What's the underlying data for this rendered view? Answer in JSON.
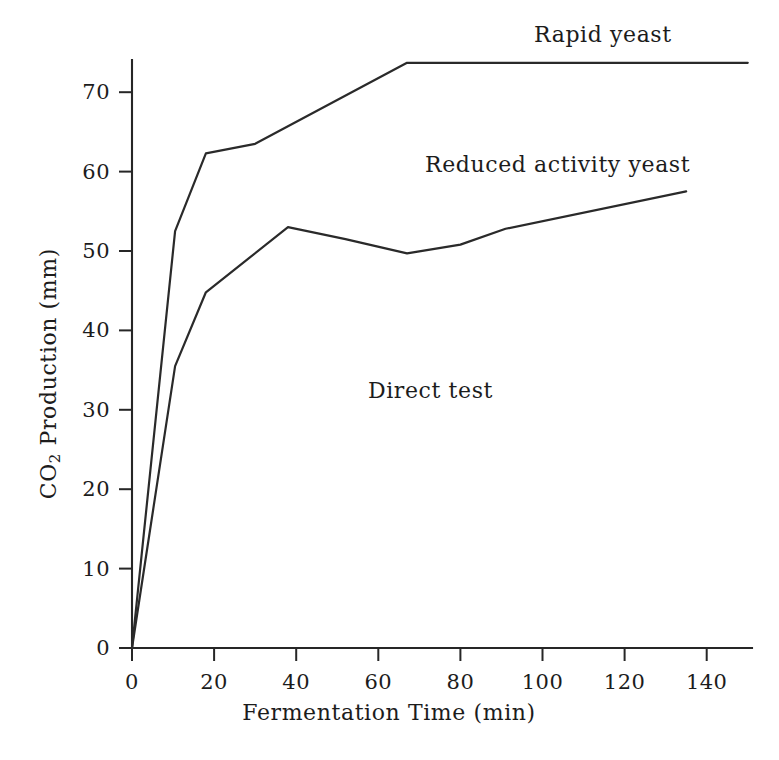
{
  "chart_data": {
    "type": "line",
    "title": "",
    "xlabel": "Fermentation Time (min)",
    "ylabel": "CO2 Production (mm)",
    "ylabel_parts": {
      "pre": "CO",
      "sub": "2",
      "post": " Production (mm)"
    },
    "xlim": [
      0,
      150
    ],
    "ylim": [
      0,
      76
    ],
    "grid": false,
    "legend_position": "inline-annotations",
    "xticks": [
      0,
      20,
      40,
      60,
      80,
      100,
      120,
      140
    ],
    "xtick_labels": [
      "0",
      "20",
      "40",
      "60",
      "80",
      "100",
      "120",
      "140"
    ],
    "yticks": [
      0,
      10,
      20,
      30,
      40,
      50,
      60,
      70
    ],
    "ytick_labels": [
      "0",
      "10",
      "20",
      "30",
      "40",
      "50",
      "60",
      "70"
    ],
    "series": [
      {
        "name": "Rapid yeast",
        "x": [
          0,
          10.5,
          18,
          30,
          67,
          150
        ],
        "y": [
          0,
          52.5,
          62.3,
          63.5,
          73.7,
          73.7
        ]
      },
      {
        "name": "Reduced activity yeast",
        "x": [
          0,
          10.5,
          18,
          38,
          52,
          67,
          80,
          91,
          135
        ],
        "y": [
          0,
          35.5,
          44.8,
          53.0,
          51.5,
          49.7,
          50.8,
          52.8,
          57.5
        ]
      }
    ],
    "annotations": [
      {
        "text": "Rapid yeast",
        "x_px": 534,
        "y_px": 22
      },
      {
        "text": "Reduced activity yeast",
        "x_px": 425,
        "y_px": 152
      },
      {
        "text": "Direct test",
        "x_px": 368,
        "y_px": 378
      }
    ]
  },
  "figure": {
    "background_color": "#ffffff",
    "ink_color": "#262626"
  }
}
